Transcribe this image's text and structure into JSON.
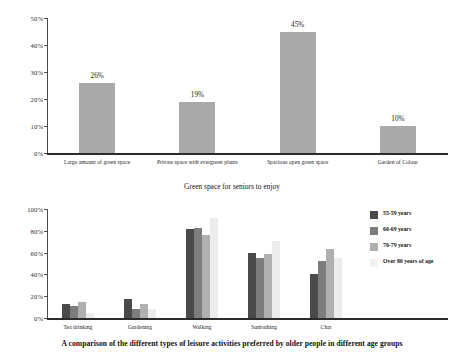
{
  "figure_top": {
    "caption": "Green space for seniors to enjoy",
    "chart_data": {
      "type": "bar",
      "title": "Green space for seniors to enjoy",
      "xlabel": "",
      "ylabel": "",
      "ylim": [
        0,
        50
      ],
      "ytick_labels": [
        "0%",
        "10%",
        "20%",
        "30%",
        "40%",
        "50%"
      ],
      "ytick_values": [
        0,
        10,
        20,
        30,
        40,
        50
      ],
      "grid": false,
      "legend": "none",
      "bar_color": "#a9a9a9",
      "categories": [
        "Large amount of green space",
        "Private space with evergreen plants",
        "Spacious open green space",
        "Garden of Colour"
      ],
      "values": [
        26,
        19,
        45,
        10
      ],
      "data_labels": [
        "26%",
        "19%",
        "45%",
        "10%"
      ]
    }
  },
  "figure_bottom": {
    "caption": "A comparison of the different types of leisure activities preferred by older people in different age groups",
    "chart_data": {
      "type": "bar",
      "title": "A comparison of the different types of leisure activities preferred by older people in different age groups",
      "xlabel": "",
      "ylabel": "",
      "ylim": [
        0,
        100
      ],
      "ytick_labels": [
        "0%",
        "20%",
        "40%",
        "60%",
        "80%",
        "100%"
      ],
      "ytick_values": [
        0,
        20,
        40,
        60,
        80,
        100
      ],
      "grid": false,
      "legend": "right",
      "categories": [
        "Tea drinking",
        "Gardening",
        "Walking",
        "Sunbathing",
        "Chat"
      ],
      "series": [
        {
          "name": "55-59 years",
          "color": "#4a4a4a",
          "values": [
            13,
            17,
            82,
            60,
            40
          ]
        },
        {
          "name": "60-69 years",
          "color": "#7d7d7d",
          "values": [
            11,
            8,
            83,
            55,
            52
          ]
        },
        {
          "name": "70-79 years",
          "color": "#b0b0b0",
          "values": [
            15,
            13,
            76,
            59,
            63
          ]
        },
        {
          "name": "Over 80 years of age",
          "color": "#ececec",
          "values": [
            5,
            8,
            92,
            71,
            55
          ]
        }
      ]
    },
    "legend_items": [
      {
        "label": "55-59 years",
        "color": "#4a4a4a"
      },
      {
        "label": "60-69 years",
        "color": "#7d7d7d"
      },
      {
        "label": "70-79 years",
        "color": "#b0b0b0"
      },
      {
        "label": "Over 80 years of age",
        "color": "#f2f2f2"
      }
    ]
  }
}
